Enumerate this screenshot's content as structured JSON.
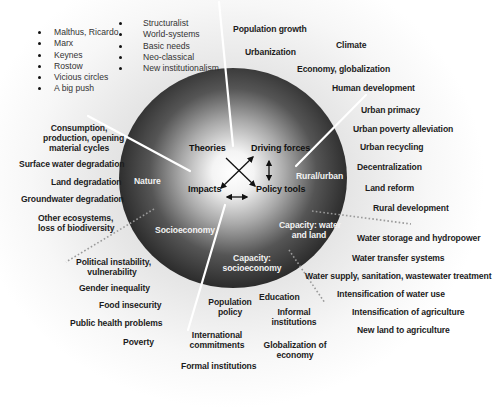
{
  "theories_list_left": [
    "Malthus, Ricardo",
    "Marx",
    "Keynes",
    "Rostow",
    "Vicious circles",
    "A big push"
  ],
  "theories_list_right": [
    "Structuralist",
    "World-systems",
    "Basic needs",
    "Neo-classical",
    "New institutionalism"
  ],
  "core": {
    "theories": "Theories",
    "driving_forces": "Driving forces",
    "impacts": "Impacts",
    "policy_tools": "Policy tools"
  },
  "sectors": {
    "nature": "Nature",
    "socioeconomy": "Socioeconomy",
    "rural_urban": "Rural/urban",
    "capacity_water_land_1": "Capacity: water",
    "capacity_water_land_2": "and land",
    "capacity_socio_1": "Capacity:",
    "capacity_socio_2": "socioeconomy"
  },
  "driving_forces": [
    "Population growth",
    "Urbanization",
    "Climate",
    "Economy, globalization",
    "Human development"
  ],
  "rural_urban_tools": [
    "Urban primacy",
    "Urban poverty alleviation",
    "Urban recycling",
    "Decentralization",
    "Land reform",
    "Rural development"
  ],
  "water_land_tools": [
    "Water storage and hydropower",
    "Water transfer systems",
    "Water supply, sanitation, wastewater treatment",
    "Intensification of water use",
    "Intensification of agriculture",
    "New land to agriculture"
  ],
  "socio_tools": {
    "education": "Education",
    "population_policy_1": "Population",
    "population_policy_2": "policy",
    "informal_1": "Informal",
    "informal_2": "institutions",
    "international_1": "International",
    "international_2": "commitments",
    "globalization_1": "Globalization of",
    "globalization_2": "economy",
    "formal": "Formal institutions"
  },
  "socio_impacts": {
    "political_1": "Political instability,",
    "political_2": "vulnerability",
    "gender": "Gender inequality",
    "food": "Food insecurity",
    "health": "Public health problems",
    "poverty": "Poverty"
  },
  "nature_impacts": {
    "consumption_1": "Consumption,",
    "consumption_2": "production, opening",
    "consumption_3": "material cycles",
    "surface": "Surface water degradation",
    "land": "Land degradation",
    "groundwater": "Groundwater degradation",
    "ecosystems_1": "Other ecosystems,",
    "ecosystems_2": "loss of biodiversity"
  },
  "colors": {
    "sphere_dark": "#2e2e2e",
    "sphere_light": "#ffffff",
    "text": "#1c1c1c",
    "inner_text": "#f2f2f2"
  }
}
